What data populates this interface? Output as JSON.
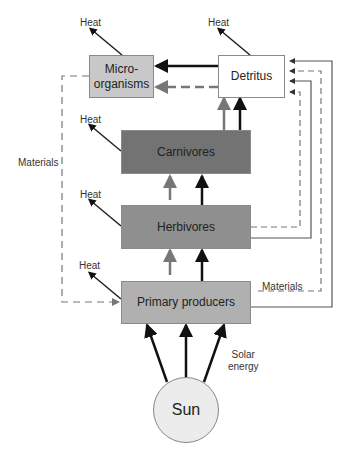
{
  "diagram": {
    "type": "ecosystem energy and materials flow",
    "nodes": {
      "microorganisms": {
        "label": "Micro-\norganisms",
        "fill": "#c8c8c8"
      },
      "detritus": {
        "label": "Detritus",
        "fill": "#ffffff"
      },
      "carnivores": {
        "label": "Carnivores",
        "fill": "#737373"
      },
      "herbivores": {
        "label": "Herbivores",
        "fill": "#8f8f8f"
      },
      "primary_producers": {
        "label": "Primary producers",
        "fill": "#b0b0b0"
      },
      "sun": {
        "label": "Sun",
        "fill": "#ececec"
      }
    },
    "labels": {
      "heat": "Heat",
      "materials_left": "Materials",
      "materials_right": "Materials",
      "solar_energy_line1": "Solar",
      "solar_energy_line2": "energy"
    },
    "legend_colors": {
      "energy_arrow": "#111111",
      "materials_arrow": "#777777",
      "return_line": "#666666"
    }
  }
}
